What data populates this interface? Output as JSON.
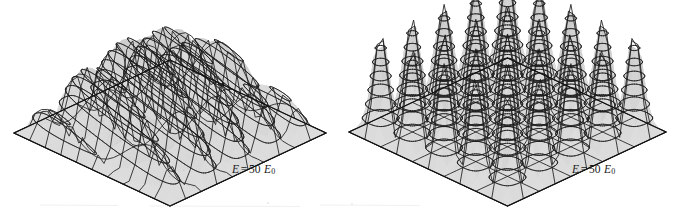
{
  "figure": {
    "type": "dual-3d-surface-plot",
    "background_color": "#ffffff",
    "surface_fill": "#e2e2e2",
    "surface_fill_dark": "#cfcfcf",
    "line_color": "#1c1c1c",
    "base_edge_color": "#111111",
    "panels": [
      {
        "id": "left",
        "name": "degenerate-superposition-surface",
        "energy_label": {
          "symbol": "E",
          "operator": "=",
          "value": "50",
          "unit_symbol": "E",
          "unit_subscript": "0",
          "full_text": "E = 50 E0"
        }
      },
      {
        "id": "right",
        "name": "separable-eigenstate-surface",
        "energy_label": {
          "symbol": "E",
          "operator": "=",
          "value": "50",
          "unit_symbol": "E",
          "unit_subscript": "0",
          "full_text": "E = 50 E0"
        }
      }
    ]
  },
  "chart_data": [
    {
      "type": "surface",
      "id": "left",
      "title": "",
      "xlabel": "",
      "ylabel": "",
      "zlabel": "",
      "annotations": [
        "E = 50 E0"
      ],
      "grid": true,
      "legend": false,
      "projection": "isometric",
      "description": "Probability density |psi|^2 over a square 2D infinite well, superposition of degenerate states with n1^2+n2^2 = 50, producing slanted ridges across the well.",
      "quantum_numbers": {
        "n1": 5,
        "n2": 5,
        "sum_squares": 50
      },
      "nx_peaks": 5,
      "ny_peaks": 5,
      "contour_levels": 6,
      "xlim": [
        0,
        1
      ],
      "ylim": [
        0,
        1
      ],
      "zlim": [
        0,
        1
      ],
      "surface_function": "ridge",
      "ridge_count": 6,
      "ridge_angle_deg": 26,
      "mesh_u": 26,
      "mesh_v": 26
    },
    {
      "type": "surface",
      "id": "right",
      "title": "",
      "xlabel": "",
      "ylabel": "",
      "zlabel": "",
      "annotations": [
        "E = 50 E0"
      ],
      "grid": true,
      "legend": false,
      "projection": "isometric",
      "description": "Probability density |psi|^2 for the separable eigenstate n1=5, n2=5 of a 2D infinite square well, giving a 5 by 5 array of equal peaks.",
      "quantum_numbers": {
        "n1": 5,
        "n2": 5,
        "sum_squares": 50
      },
      "nx_peaks": 5,
      "ny_peaks": 5,
      "contour_levels": 6,
      "xlim": [
        0,
        1
      ],
      "ylim": [
        0,
        1
      ],
      "zlim": [
        0,
        1
      ],
      "surface_function": "sin^2(5 pi x) sin^2(5 pi y)",
      "mesh_u": 26,
      "mesh_v": 26
    }
  ],
  "geometry": {
    "left_panel": {
      "left_vertex_x": 13,
      "top_vertex_y": 22,
      "right_vertex_x": 325,
      "bottom_vertex_y": 205
    },
    "right_panel": {
      "left_vertex_x": 348,
      "top_vertex_y": 20,
      "right_vertex_x": 665,
      "bottom_vertex_y": 205
    }
  }
}
